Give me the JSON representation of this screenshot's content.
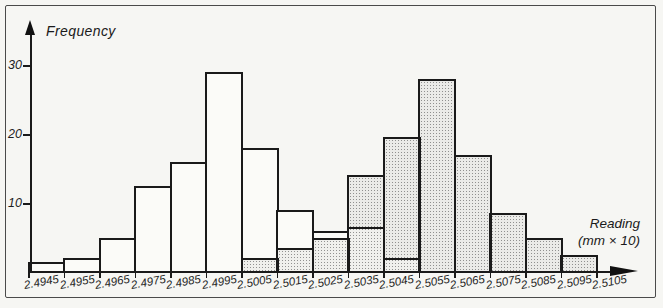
{
  "figure": {
    "y_axis_label": "Frequency",
    "x_axis_label_line1": "Reading",
    "x_axis_label_line2": "(mm × 10)"
  },
  "chart_data": {
    "type": "bar",
    "subtype": "overlaid-histograms",
    "title": "",
    "xlabel": "Reading (mm × 10)",
    "ylabel": "Frequency",
    "grid": false,
    "legend_position": "none",
    "ylim": [
      0,
      33
    ],
    "y_ticks": [
      10,
      20,
      30
    ],
    "bin_edges": [
      2.4945,
      2.4955,
      2.4965,
      2.4975,
      2.4985,
      2.4995,
      2.5005,
      2.5015,
      2.5025,
      2.5035,
      2.5045,
      2.5055,
      2.5065,
      2.5075,
      2.5085,
      2.5095,
      2.5105
    ],
    "x_tick_labels": [
      "2.4945",
      "2.4955",
      "2.4965",
      "2.4975",
      "2.4985",
      "2.4995",
      "2.5005",
      "2.5015",
      "2.5025",
      "2.5035",
      "2.5045",
      "2.5055",
      "2.5065",
      "2.5075",
      "2.5085",
      "2.5095",
      "2.5105"
    ],
    "series": [
      {
        "name": "open-bars-histogram",
        "fill": "open-white",
        "start_bin_index": 0,
        "bin_start": 2.4945,
        "values": [
          1.5,
          2,
          5,
          12.5,
          16,
          29,
          18,
          9,
          6,
          6.5,
          2
        ]
      },
      {
        "name": "stippled-bars-histogram",
        "fill": "stippled-dots",
        "start_bin_index": 6,
        "bin_start": 2.5005,
        "values": [
          2,
          3.5,
          5,
          14,
          19.5,
          28,
          17,
          8.5,
          5,
          2.5
        ]
      }
    ]
  },
  "colors": {
    "paper": "#f6f6f3",
    "bar_outline": "#1a1a1a",
    "open_bar_fill": "#fbfbf8",
    "stipple_dot": "#5a5a5a",
    "frame": "#4a4a4a"
  }
}
